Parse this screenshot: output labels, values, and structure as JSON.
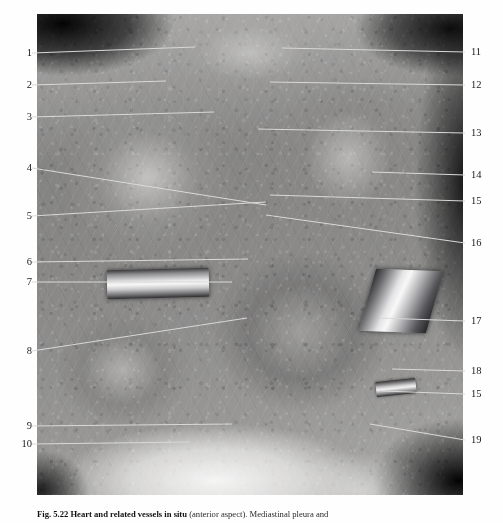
{
  "figure": {
    "plate_description": "Anatomical dissection photograph: heart and related vessels in situ, anterior view, thorax opened",
    "caption": {
      "figure_number": "Fig. 5.22",
      "title": "Heart and related vessels in situ",
      "detail": "(anterior aspect).",
      "trailing": "Mediastinal pleura and",
      "full_text": "Fig. 5.22  Heart and related vessels in situ (anterior aspect). Mediastinal pleura and"
    }
  },
  "labels_left": [
    {
      "number": "1",
      "x": 20,
      "y": 53,
      "leader_to_x": 195,
      "leader_to_y": 47
    },
    {
      "number": "2",
      "x": 20,
      "y": 85,
      "leader_to_x": 166,
      "leader_to_y": 81
    },
    {
      "number": "3",
      "x": 20,
      "y": 117,
      "leader_to_x": 214,
      "leader_to_y": 112
    },
    {
      "number": "4",
      "x": 20,
      "y": 168,
      "leader_to_x": 266,
      "leader_to_y": 205
    },
    {
      "number": "5",
      "x": 20,
      "y": 216,
      "leader_to_x": 266,
      "leader_to_y": 202
    },
    {
      "number": "6",
      "x": 20,
      "y": 262,
      "leader_to_x": 248,
      "leader_to_y": 259
    },
    {
      "number": "7",
      "x": 20,
      "y": 282,
      "leader_to_x": 232,
      "leader_to_y": 282
    },
    {
      "number": "8",
      "x": 20,
      "y": 351,
      "leader_to_x": 247,
      "leader_to_y": 318
    },
    {
      "number": "9",
      "x": 20,
      "y": 426,
      "leader_to_x": 232,
      "leader_to_y": 424
    },
    {
      "number": "10",
      "x": 20,
      "y": 444,
      "leader_to_x": 190,
      "leader_to_y": 442
    }
  ],
  "labels_right": [
    {
      "number": "11",
      "x": 471,
      "y": 52,
      "leader_to_x": 282,
      "leader_to_y": 48
    },
    {
      "number": "12",
      "x": 471,
      "y": 85,
      "leader_to_x": 270,
      "leader_to_y": 82
    },
    {
      "number": "13",
      "x": 471,
      "y": 133,
      "leader_to_x": 258,
      "leader_to_y": 129
    },
    {
      "number": "14",
      "x": 471,
      "y": 175,
      "leader_to_x": 372,
      "leader_to_y": 172
    },
    {
      "number": "15",
      "x": 471,
      "y": 201,
      "leader_to_x": 270,
      "leader_to_y": 195
    },
    {
      "number": "16",
      "x": 471,
      "y": 243,
      "leader_to_x": 266,
      "leader_to_y": 215
    },
    {
      "number": "17",
      "x": 471,
      "y": 321,
      "leader_to_x": 380,
      "leader_to_y": 318
    },
    {
      "number": "18",
      "x": 471,
      "y": 371,
      "leader_to_x": 392,
      "leader_to_y": 369
    },
    {
      "number": "15",
      "x": 471,
      "y": 394,
      "leader_to_x": 382,
      "leader_to_y": 391
    },
    {
      "number": "19",
      "x": 471,
      "y": 440,
      "leader_to_x": 370,
      "leader_to_y": 424
    }
  ],
  "colors": {
    "page_background": "#fefefe",
    "leader_line": "#d9d9d9",
    "label_text": "#1b1b1b",
    "caption_text": "#2a2a2a"
  }
}
